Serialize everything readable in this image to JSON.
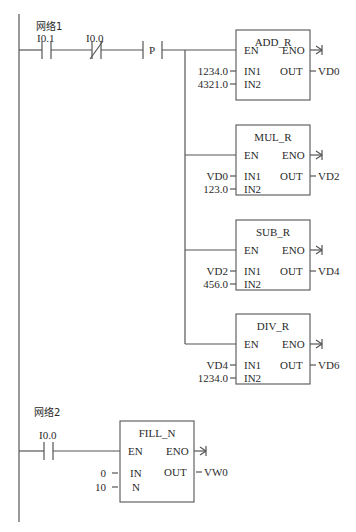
{
  "networks": [
    {
      "label": "网络1",
      "contacts": [
        {
          "name": "I0.1",
          "type": "normally-open"
        },
        {
          "name": "I0.0",
          "type": "normally-closed"
        },
        {
          "name": "P",
          "type": "positive-transition"
        }
      ],
      "blocks": [
        {
          "title": "ADD_R",
          "en": "EN",
          "eno": "ENO",
          "in1_label": "IN1",
          "in2_label": "IN2",
          "out_label": "OUT",
          "in1": "1234.0",
          "in2": "4321.0",
          "out": "VD0"
        },
        {
          "title": "MUL_R",
          "en": "EN",
          "eno": "ENO",
          "in1_label": "IN1",
          "in2_label": "IN2",
          "out_label": "OUT",
          "in1": "VD0",
          "in2": "123.0",
          "out": "VD2"
        },
        {
          "title": "SUB_R",
          "en": "EN",
          "eno": "ENO",
          "in1_label": "IN1",
          "in2_label": "IN2",
          "out_label": "OUT",
          "in1": "VD2",
          "in2": "456.0",
          "out": "VD4"
        },
        {
          "title": "DIV_R",
          "en": "EN",
          "eno": "ENO",
          "in1_label": "IN1",
          "in2_label": "IN2",
          "out_label": "OUT",
          "in1": "VD4",
          "in2": "1234.0",
          "out": "VD6"
        }
      ]
    },
    {
      "label": "网络2",
      "contacts": [
        {
          "name": "I0.0",
          "type": "normally-open"
        }
      ],
      "blocks": [
        {
          "title": "FILL_N",
          "en": "EN",
          "eno": "ENO",
          "in1_label": "IN",
          "in2_label": "N",
          "out_label": "OUT",
          "in1": "0",
          "in2": "10",
          "out": "VW0"
        }
      ]
    }
  ]
}
